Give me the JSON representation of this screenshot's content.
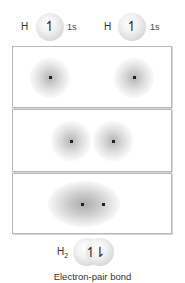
{
  "atoms": [
    {
      "symbol": "H",
      "orbital": "1s",
      "spin": "↿"
    },
    {
      "symbol": "H",
      "orbital": "1s",
      "spin": "↿"
    }
  ],
  "panels": [
    {
      "stage": "separated",
      "nuclei_x": [
        50,
        134
      ]
    },
    {
      "stage": "approaching",
      "nuclei_x": [
        71,
        113
      ]
    },
    {
      "stage": "bonded",
      "nuclei_x": [
        82,
        103
      ]
    }
  ],
  "molecule": {
    "symbol": "H",
    "subscript": "2",
    "spin": "↿⇂"
  },
  "caption": "Electron-pair bond",
  "colors": {
    "panel_border": "#b8b8b8",
    "nucleus": "#222222",
    "text": "#333333"
  }
}
